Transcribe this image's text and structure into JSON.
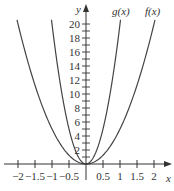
{
  "chart_data": {
    "type": "line",
    "title": "",
    "xlabel": "x",
    "ylabel": "y",
    "xlim": [
      -2.25,
      2.45
    ],
    "ylim": [
      0,
      21
    ],
    "grid": false,
    "x_ticks": [
      -2,
      -1.5,
      -1,
      -0.5,
      0.5,
      1,
      1.5,
      2
    ],
    "x_tick_labels": [
      "−2",
      "−1.5",
      "−1",
      "−0.5",
      "0.5",
      "1",
      "1.5",
      "2"
    ],
    "y_ticks": [
      1,
      2,
      3,
      4,
      5,
      6,
      7,
      8,
      9,
      10,
      11,
      12,
      13,
      14,
      15,
      16,
      17,
      18,
      19,
      20
    ],
    "y_tick_labels_shown": [
      2,
      4,
      6,
      8,
      10,
      12,
      14,
      16,
      18,
      20
    ],
    "series": [
      {
        "name": "f(x)",
        "formula": "5x^2",
        "x": [
          -2.03,
          -2,
          -1.5,
          -1,
          -0.5,
          0,
          0.5,
          1,
          1.5,
          2,
          2.03
        ],
        "y": [
          20.6,
          20,
          11.25,
          5,
          1.25,
          0,
          1.25,
          5,
          11.25,
          20,
          20.6
        ]
      },
      {
        "name": "g(x)",
        "formula": "20x^2",
        "x": [
          -1.02,
          -1,
          -0.75,
          -0.5,
          -0.25,
          0,
          0.25,
          0.5,
          0.75,
          1,
          1.02
        ],
        "y": [
          20.8,
          20,
          11.25,
          5,
          1.25,
          0,
          1.25,
          5,
          11.25,
          20,
          20.8
        ]
      }
    ],
    "annotations": [
      {
        "text": "g(x)",
        "near": "top of inner curve, right branch"
      },
      {
        "text": "f(x)",
        "near": "top of outer curve, right branch"
      }
    ],
    "legend": "none (curve labels inline)"
  },
  "labels": {
    "x_axis": "x",
    "y_axis": "y",
    "f": "f(x)",
    "g": "g(x)"
  },
  "colors": {
    "curve": "#444444",
    "axis": "#333333",
    "background": "#ffffff"
  }
}
